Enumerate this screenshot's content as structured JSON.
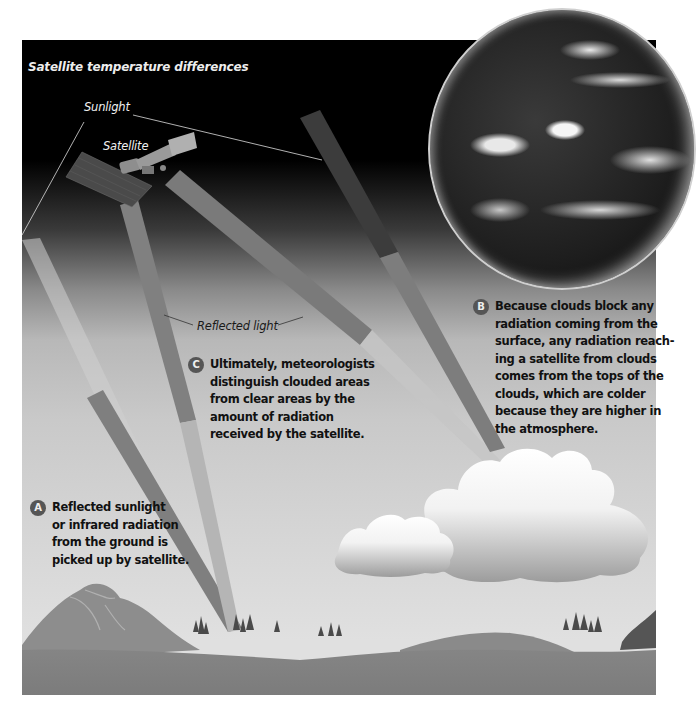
{
  "title": "Satellite temperature differences",
  "labels": {
    "sunlight": "Sunlight",
    "satellite": "Satellite",
    "reflected_light": "Reflected light"
  },
  "callouts": [
    {
      "badge": "A",
      "lines": [
        "Reflected sunlight",
        "or infrared radiation",
        "from the ground is",
        "picked up by satellite."
      ]
    },
    {
      "badge": "B",
      "lines": [
        "Because clouds block any",
        "radiation coming from the",
        "surface, any radiation reach-",
        "ing a satellite from clouds",
        "comes from the tops of the",
        "clouds, which are colder",
        "because they are higher in",
        "the atmosphere."
      ]
    },
    {
      "badge": "C",
      "lines": [
        "Ultimately, meteorologists",
        "distinguish clouded areas",
        "from clear areas by the",
        "amount of radiation",
        "received by the satellite."
      ]
    }
  ],
  "colors": {
    "space": "#000000",
    "sky_low": "#e0e0e0",
    "beam": "#7d7d7d",
    "ground": "#7a7a7a",
    "badge": "#555555"
  }
}
